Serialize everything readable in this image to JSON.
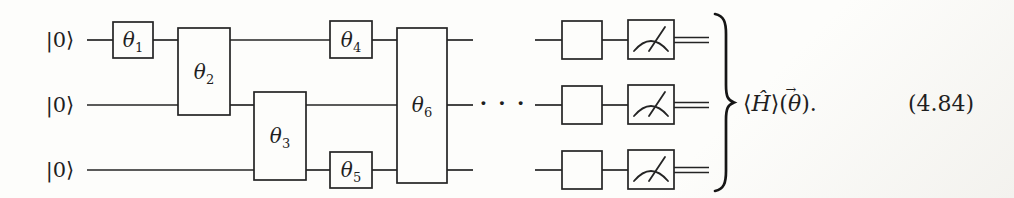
{
  "figure": {
    "background": "#fdfdfb",
    "ink": "#1f1f1f",
    "kind": "quantum-circuit"
  },
  "circuit": {
    "qubits": [
      {
        "label": "|0⟩"
      },
      {
        "label": "|0⟩"
      },
      {
        "label": "|0⟩"
      }
    ],
    "gates": [
      {
        "name": "theta-1",
        "base": "θ",
        "sub": "1"
      },
      {
        "name": "theta-2",
        "base": "θ",
        "sub": "2"
      },
      {
        "name": "theta-3",
        "base": "θ",
        "sub": "3"
      },
      {
        "name": "theta-4",
        "base": "θ",
        "sub": "4"
      },
      {
        "name": "theta-5",
        "base": "θ",
        "sub": "5"
      },
      {
        "name": "theta-6",
        "base": "θ",
        "sub": "6"
      }
    ],
    "ellipsis": "· · ·",
    "unlabeled_gate_count": 3,
    "measurement_count": 3
  },
  "annotation": {
    "expectation": {
      "open_angle": "⟨",
      "hamiltonian": "Ĥ",
      "close_angle_open_paren": "⟩(",
      "theta": "θ",
      "vector_arrow": "→",
      "close": ")."
    },
    "equation_number": "(4.84)"
  }
}
